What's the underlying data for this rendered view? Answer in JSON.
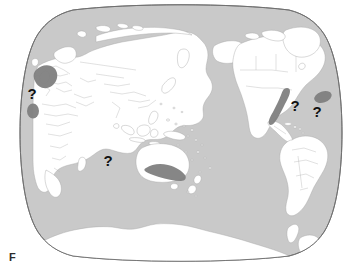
{
  "figure": {
    "kind": "world-distribution-map",
    "projection": "robinson-pseudocylindrical",
    "center_longitude": "90E",
    "background_color": "#ffffff",
    "caption_fragment": "F"
  },
  "map": {
    "ocean_color": "#c9c9c9",
    "land_color": "#ffffff",
    "border_color": "#a9a9a9",
    "outline_color": "#6e6e6e",
    "highlight_color": "#808080",
    "marker_color": "#111111"
  },
  "markers": [
    {
      "id": "marker-ne-atlantic",
      "label": "?",
      "region": "Northeast Atlantic off Iberia",
      "x": 32,
      "y": 99
    },
    {
      "id": "marker-west-indian-ocean",
      "label": "?",
      "region": "Western Indian Ocean west of Australia",
      "x": 108,
      "y": 166
    },
    {
      "id": "marker-west-atlantic",
      "label": "?",
      "region": "Western Atlantic off Florida",
      "x": 295,
      "y": 111
    },
    {
      "id": "marker-mid-atlantic",
      "label": "?",
      "region": "Mid Atlantic near Canary Islands",
      "x": 317,
      "y": 117
    }
  ],
  "highlights": [
    {
      "id": "highlight-north-sea",
      "region": "British Isles and North Sea",
      "color": "#808080"
    },
    {
      "id": "highlight-northwest-africa",
      "region": "Northwest African coast",
      "color": "#808080"
    },
    {
      "id": "highlight-us-east-coast",
      "region": "United States east coast shelf",
      "color": "#808080"
    },
    {
      "id": "highlight-mid-atlantic-ellipse",
      "region": "Mid Atlantic Madeira and Canary waters",
      "color": "#808080"
    },
    {
      "id": "highlight-southern-australia",
      "region": "Southern Australia Great Australian Bight",
      "color": "#808080"
    }
  ],
  "landmasses": [
    {
      "id": "land-eurasia-africa",
      "name": "Eurasia and Africa"
    },
    {
      "id": "land-australia",
      "name": "Australia"
    },
    {
      "id": "land-north-america",
      "name": "North America"
    },
    {
      "id": "land-south-america",
      "name": "South America"
    },
    {
      "id": "land-antarctica",
      "name": "Antarctica"
    },
    {
      "id": "land-greenland",
      "name": "Greenland"
    },
    {
      "id": "land-new-zealand",
      "name": "New Zealand"
    },
    {
      "id": "land-japan",
      "name": "Japan"
    },
    {
      "id": "land-indonesia",
      "name": "Indonesian archipelago"
    },
    {
      "id": "land-philippines",
      "name": "Philippines"
    },
    {
      "id": "land-british-isles",
      "name": "British Isles"
    },
    {
      "id": "land-madagascar",
      "name": "Madagascar"
    },
    {
      "id": "land-iceland",
      "name": "Iceland"
    },
    {
      "id": "land-caribbean",
      "name": "Caribbean islands"
    },
    {
      "id": "land-pacific-islands",
      "name": "Pacific islands"
    }
  ]
}
